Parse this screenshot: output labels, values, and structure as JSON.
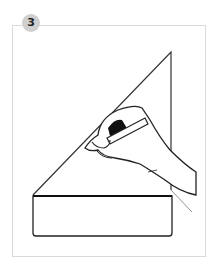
{
  "step": {
    "number": "3"
  },
  "illustration": {
    "description": "Hand holding a pencil tracing a line along a triangular flap above a rectangular base",
    "stroke_color": "#222222",
    "frame_color": "#d9d9d9",
    "badge_color": "#cfcfcf"
  }
}
